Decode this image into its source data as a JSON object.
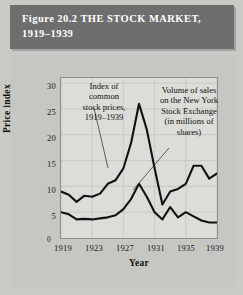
{
  "figure": {
    "title": "Figure 20.2  THE STOCK MARKET,\n1919–1939",
    "banner_color": "#6e6e6e",
    "background_color": "#c9c9c5",
    "plot_background_color": "#dcdcd8",
    "line_color": "#111111"
  },
  "annotations": {
    "index_note": "Index of\ncommon\nstock prices,\n1919–1939",
    "volume_note": "Volume of sales\non the New York\nStock Exchange\n(in millions of\nshares)"
  },
  "axes": {
    "y_label": "Price index",
    "x_label": "Year",
    "origin_label": "0",
    "y_ticks": [
      "30",
      "25",
      "20",
      "15",
      "10",
      "5"
    ],
    "x_ticks": [
      "1919",
      "1923",
      "1927",
      "1931",
      "1935",
      "1939"
    ]
  },
  "chart_data": {
    "type": "line",
    "title": "Figure 20.2  THE STOCK MARKET, 1919–1939",
    "xlabel": "Year",
    "ylabel": "Price index",
    "xlim": [
      1919,
      1939
    ],
    "ylim": [
      0,
      31
    ],
    "grid": true,
    "legend": "none",
    "x": [
      1919,
      1920,
      1921,
      1922,
      1923,
      1924,
      1925,
      1926,
      1927,
      1928,
      1929,
      1930,
      1931,
      1932,
      1933,
      1934,
      1935,
      1936,
      1937,
      1938,
      1939
    ],
    "series": [
      {
        "name": "Index of common stock prices, 1919–1939",
        "annotation": "Index of common stock prices, 1919–1939",
        "values": [
          9.0,
          8.4,
          7.0,
          8.2,
          8.0,
          8.6,
          10.5,
          11.2,
          13.5,
          18.5,
          26.0,
          21.0,
          13.5,
          6.5,
          9.0,
          9.5,
          10.5,
          14.0,
          14.0,
          11.5,
          12.5
        ]
      },
      {
        "name": "Volume of sales on the New York Stock Exchange (in millions of shares)",
        "annotation": "Volume of sales on the New York Stock Exchange (in millions of shares)",
        "values": [
          5.0,
          4.6,
          3.6,
          3.7,
          3.6,
          3.8,
          4.0,
          4.4,
          5.6,
          7.6,
          10.5,
          8.0,
          5.0,
          3.6,
          6.0,
          4.0,
          5.0,
          4.2,
          3.4,
          3.0,
          3.0
        ]
      }
    ]
  }
}
